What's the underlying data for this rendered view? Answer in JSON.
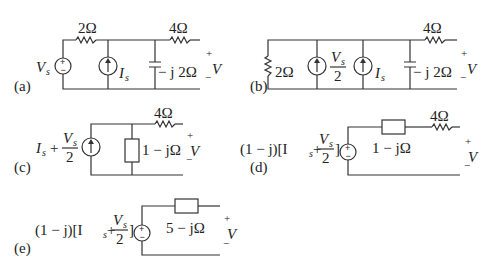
{
  "figure": {
    "line_color": "#333333",
    "text_color": "#222222",
    "panels": {
      "a": {
        "label": "(a)",
        "voltage_source": "V",
        "voltage_source_sub": "s",
        "current_source": "I",
        "current_source_sub": "s",
        "series_resistor": "2Ω",
        "capacitor": "− j 2Ω",
        "output_resistor": "4Ω",
        "output_plus": "+",
        "output_v": "V",
        "output_minus": "−"
      },
      "b": {
        "label": "(b)",
        "shunt_resistor": "2Ω",
        "current_source_1_num": "V",
        "current_source_1_num_sub": "s",
        "current_source_1_den": "2",
        "current_source_2": "I",
        "current_source_2_sub": "s",
        "capacitor": "− j 2Ω",
        "output_resistor": "4Ω",
        "output_plus": "+",
        "output_v": "V",
        "output_minus": "−"
      },
      "c": {
        "label": "(c)",
        "source_prefix": "I",
        "source_prefix_sub": "s",
        "source_plus": "+",
        "source_frac_num": "V",
        "source_frac_num_sub": "s",
        "source_frac_den": "2",
        "impedance": "1 − jΩ",
        "output_resistor": "4Ω",
        "output_plus": "+",
        "output_v": "V",
        "output_minus": "−"
      },
      "d": {
        "label": "(d)",
        "source_expr_left": "(1 − j)[I",
        "source_expr_sub": "s",
        "source_expr_plus": " + ",
        "source_frac_num": "V",
        "source_frac_num_sub": "s",
        "source_frac_den": "2",
        "source_expr_right": "]",
        "impedance": "1 − jΩ",
        "output_resistor": "4Ω",
        "output_plus": "+",
        "output_v": "V",
        "output_minus": "−"
      },
      "e": {
        "label": "(e)",
        "source_expr_left": "(1 − j)[I",
        "source_expr_sub": "s",
        "source_expr_plus": " + ",
        "source_frac_num": "V",
        "source_frac_num_sub": "s",
        "source_frac_den": "2",
        "source_expr_right": "]",
        "impedance": "5 − jΩ",
        "output_plus": "+",
        "output_v": "V",
        "output_minus": "−"
      }
    }
  }
}
